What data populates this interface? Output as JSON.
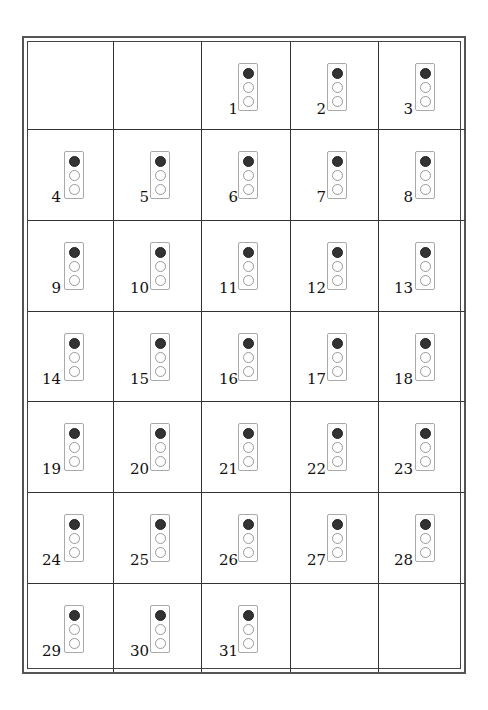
{
  "calendar": {
    "leading_blanks": 2,
    "days": [
      "1",
      "2",
      "3",
      "4",
      "5",
      "6",
      "7",
      "8",
      "9",
      "10",
      "11",
      "12",
      "13",
      "14",
      "15",
      "16",
      "17",
      "18",
      "19",
      "20",
      "21",
      "22",
      "23",
      "24",
      "25",
      "26",
      "27",
      "28",
      "29",
      "30",
      "31"
    ],
    "trailing_blanks": 2,
    "columns": 5,
    "rows": 7,
    "icon": "traffic-light-icon",
    "colors": {
      "red_bulb": "#333333",
      "border": "#444444"
    }
  }
}
